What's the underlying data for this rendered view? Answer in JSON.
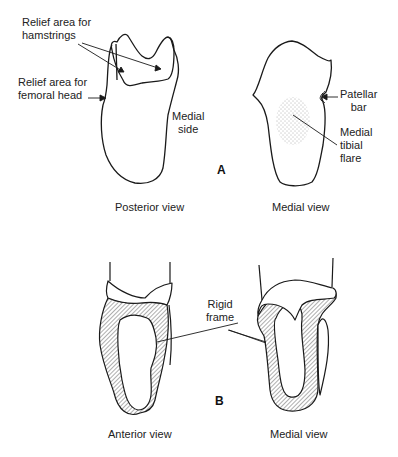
{
  "figure": {
    "panel_a": {
      "tag": "A",
      "posterior": {
        "caption": "Posterior view",
        "labels": {
          "hamstrings": [
            "Relief area for",
            "hamstrings"
          ],
          "femoral_head": [
            "Relief area for",
            "femoral head"
          ],
          "medial_side": [
            "Medial",
            "side"
          ]
        }
      },
      "medial": {
        "caption": "Medial view",
        "labels": {
          "patellar_bar": [
            "Patellar",
            "bar"
          ],
          "tibial_flare": [
            "Medial",
            "tibial",
            "flare"
          ]
        }
      }
    },
    "panel_b": {
      "tag": "B",
      "anterior": {
        "caption": "Anterior view"
      },
      "medial": {
        "caption": "Medial view"
      },
      "labels": {
        "rigid_frame": [
          "Rigid",
          "frame"
        ]
      }
    },
    "colors": {
      "line": "#1a1a1a",
      "hatch": "#333333",
      "background": "#ffffff"
    }
  }
}
